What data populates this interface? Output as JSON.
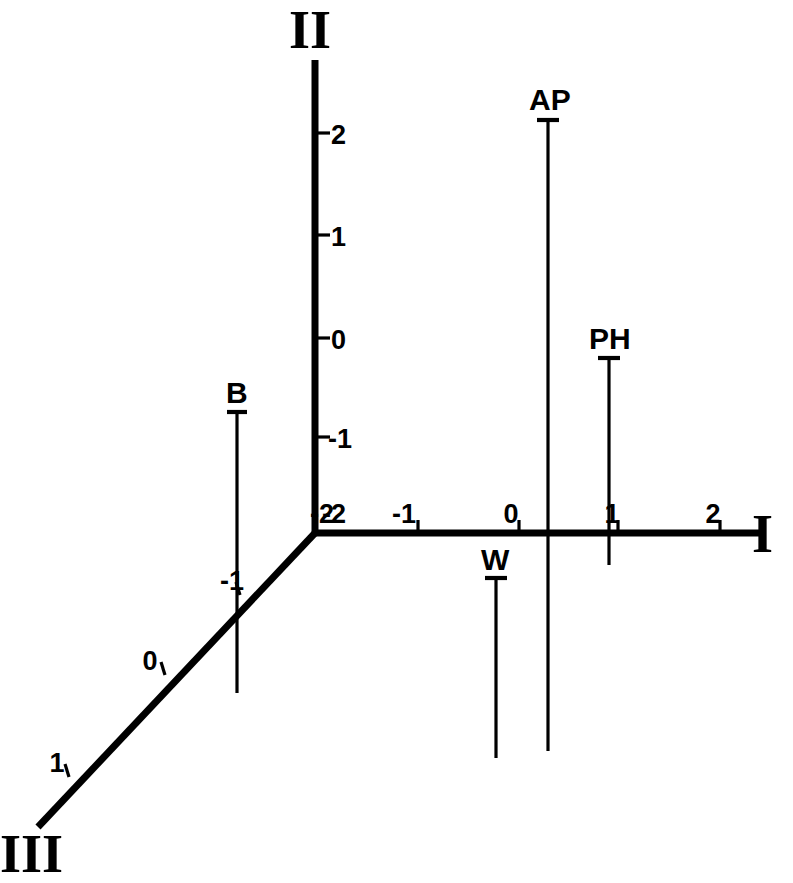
{
  "figure": {
    "type": "ternary-axes-diagram",
    "background_color": "#ffffff",
    "line_color": "#000000",
    "origin": {
      "x": 315,
      "y": 533
    },
    "unit_px": 101
  },
  "axes": [
    {
      "id": "axis-i",
      "name": "I",
      "orientation": "horizontal-right",
      "label_pos": {
        "x": 752,
        "y": 552
      },
      "line": {
        "x1": 315,
        "y1": 533,
        "x2": 765,
        "y2": 533
      },
      "ticks": [
        {
          "value": "-2",
          "x": 315,
          "y": 533,
          "label_x": 322,
          "label_y": 523
        },
        {
          "value": "-1",
          "x": 418,
          "y": 533,
          "label_x": 404,
          "label_y": 523
        },
        {
          "value": "0",
          "x": 519,
          "y": 533,
          "label_x": 511,
          "label_y": 523
        },
        {
          "value": "1",
          "x": 618,
          "y": 533,
          "label_x": 612,
          "label_y": 523
        },
        {
          "value": "2",
          "x": 720,
          "y": 533,
          "label_x": 713,
          "label_y": 523
        }
      ]
    },
    {
      "id": "axis-ii",
      "name": "II",
      "orientation": "vertical-up",
      "label_pos": {
        "x": 289,
        "y": 48
      },
      "line": {
        "x1": 315,
        "y1": 533,
        "x2": 315,
        "y2": 60
      },
      "ticks": [
        {
          "value": "2",
          "x": 315,
          "y": 133,
          "label_x": 331,
          "label_y": 144
        },
        {
          "value": "1",
          "x": 315,
          "y": 235,
          "label_x": 331,
          "label_y": 246
        },
        {
          "value": "0",
          "x": 315,
          "y": 338,
          "label_x": 331,
          "label_y": 349
        },
        {
          "value": "-1",
          "x": 315,
          "y": 437,
          "label_x": 328,
          "label_y": 448
        },
        {
          "value": "-2",
          "x": 315,
          "y": 533,
          "label_x": 322,
          "label_y": 523
        }
      ]
    },
    {
      "id": "axis-iii",
      "name": "III",
      "orientation": "diagonal-down-left",
      "label_pos": {
        "x": 0,
        "y": 872
      },
      "line": {
        "x1": 315,
        "y1": 533,
        "x2": 38,
        "y2": 827
      },
      "ticks": [
        {
          "value": "-1",
          "x": 238,
          "y": 598,
          "label_x": 232,
          "label_y": 590
        },
        {
          "value": "0",
          "x": 163,
          "y": 678,
          "label_x": 150,
          "label_y": 670
        },
        {
          "value": "1",
          "x": 67,
          "y": 780,
          "label_x": 57,
          "label_y": 772
        }
      ]
    }
  ],
  "vectors": [
    {
      "id": "vector-ap",
      "label": "AP",
      "direction": "down",
      "x": 548,
      "cap_y": 120,
      "end_y": 751,
      "cap_half_width": 11,
      "label_x": 529,
      "label_y": 110
    },
    {
      "id": "vector-ph",
      "label": "PH",
      "direction": "down",
      "x": 609,
      "cap_y": 358,
      "end_y": 565,
      "cap_half_width": 11,
      "label_x": 589,
      "label_y": 349
    },
    {
      "id": "vector-b",
      "label": "B",
      "direction": "down",
      "x": 237,
      "cap_y": 412,
      "end_y": 693,
      "cap_half_width": 10,
      "label_x": 226,
      "label_y": 403
    },
    {
      "id": "vector-w",
      "label": "W",
      "direction": "down",
      "x": 496,
      "cap_y": 578,
      "end_y": 758,
      "cap_half_width": 11,
      "label_x": 481,
      "label_y": 570
    }
  ],
  "chart_data": {
    "type": "scatter",
    "title": "",
    "xlabel": "I",
    "ylabel": "II",
    "zlabel": "III",
    "axis_names": [
      "I",
      "II",
      "III"
    ],
    "axis_i_ticks": [
      "-2",
      "-1",
      "0",
      "1",
      "2"
    ],
    "axis_ii_ticks": [
      "2",
      "1",
      "0",
      "-1",
      "-2"
    ],
    "axis_iii_ticks": [
      "-1",
      "0",
      "1"
    ],
    "grid": false,
    "legend": "none",
    "series": [
      {
        "name": "AP",
        "axis_i": 0.29,
        "span": "long"
      },
      {
        "name": "PH",
        "axis_i": 1.0,
        "span": "short"
      },
      {
        "name": "B",
        "axis_iii": -1.0,
        "span": "medium"
      },
      {
        "name": "W",
        "axis_i": -0.23,
        "span": "medium"
      }
    ]
  }
}
